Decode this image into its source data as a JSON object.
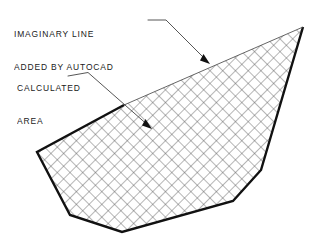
{
  "drawing": {
    "title_labels": {
      "imaginary_line": {
        "line1": "IMAGINARY LINE",
        "line2": "ADDED BY AUTOCAD"
      },
      "calculated_area": {
        "line1": "CALCULATED",
        "line2": "AREA"
      }
    },
    "colors": {
      "background": "#ffffff",
      "ink": "#111111",
      "hatch": "#5a5a5a",
      "thin_line": "#3c3c3c",
      "text": "#1a1a1a"
    },
    "shape": {
      "name": "calculated-area-polygon",
      "vertices": [
        [
          124,
          105
        ],
        [
          303,
          27
        ],
        [
          261,
          170
        ],
        [
          233,
          201
        ],
        [
          122,
          232
        ],
        [
          70,
          215
        ],
        [
          37,
          152
        ]
      ],
      "thick_edges": [
        [
          [
            303,
            27
          ],
          [
            261,
            170
          ]
        ],
        [
          [
            261,
            170
          ],
          [
            233,
            201
          ]
        ],
        [
          [
            233,
            201
          ],
          [
            122,
            232
          ]
        ],
        [
          [
            122,
            232
          ],
          [
            70,
            215
          ]
        ],
        [
          [
            70,
            215
          ],
          [
            37,
            152
          ]
        ],
        [
          [
            37,
            152
          ],
          [
            124,
            105
          ]
        ]
      ],
      "imaginary_edge": [
        [
          124,
          105
        ],
        [
          303,
          27
        ]
      ],
      "hatch_pattern": "cross-hatch-45-degree",
      "hatch_spacing_px": 9
    },
    "leaders": [
      {
        "name": "imaginary-line-leader",
        "points": [
          [
            148,
            20
          ],
          [
            166,
            20
          ],
          [
            210,
            64
          ]
        ],
        "arrow_tip": [
          210,
          64
        ],
        "arrow_angle_deg": 45
      },
      {
        "name": "calculated-area-leader",
        "points": [
          [
            68,
            76
          ],
          [
            88,
            73
          ],
          [
            152,
            129
          ]
        ],
        "arrow_tip": [
          152,
          129
        ],
        "arrow_angle_deg": 41
      }
    ]
  }
}
